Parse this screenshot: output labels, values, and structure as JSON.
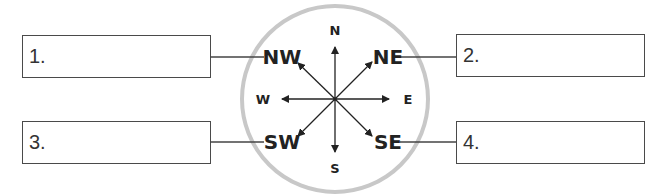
{
  "boxes": [
    {
      "id": 1,
      "label": "1.",
      "answer": ""
    },
    {
      "id": 2,
      "label": "2.",
      "answer": ""
    },
    {
      "id": 3,
      "label": "3.",
      "answer": ""
    },
    {
      "id": 4,
      "label": "4.",
      "answer": ""
    }
  ],
  "compass": {
    "cardinal": {
      "north": "N",
      "south": "S",
      "east": "E",
      "west": "W"
    },
    "intercardinal": {
      "northwest": "NW",
      "northeast": "NE",
      "southwest": "SW",
      "southeast": "SE"
    },
    "colors": {
      "ring": "#c8c8c8",
      "lines": "#222222",
      "box_border": "#4a4a4a"
    }
  }
}
